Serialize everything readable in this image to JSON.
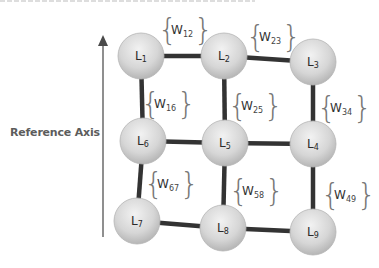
{
  "diagram": {
    "axis": {
      "label": "Reference Axis",
      "direction": "up",
      "color": "#6a6a6a"
    },
    "colors": {
      "edge": "#333333",
      "node_fill_light": "#ebebeb",
      "node_fill_dark": "#a8a8a8",
      "node_stroke": "#b5b5b5",
      "brace": "#777777",
      "text": "#2a2a2a"
    },
    "nodes": [
      {
        "id": "L1",
        "base": "L",
        "sub": "1",
        "cx": 141,
        "cy": 56
      },
      {
        "id": "L2",
        "base": "L",
        "sub": "2",
        "cx": 224,
        "cy": 56
      },
      {
        "id": "L3",
        "base": "L",
        "sub": "3",
        "cx": 313,
        "cy": 62
      },
      {
        "id": "L4",
        "base": "L",
        "sub": "4",
        "cx": 313,
        "cy": 144
      },
      {
        "id": "L5",
        "base": "L",
        "sub": "5",
        "cx": 225,
        "cy": 143
      },
      {
        "id": "L6",
        "base": "L",
        "sub": "6",
        "cx": 143,
        "cy": 141
      },
      {
        "id": "L7",
        "base": "L",
        "sub": "7",
        "cx": 137,
        "cy": 221
      },
      {
        "id": "L8",
        "base": "L",
        "sub": "8",
        "cx": 223,
        "cy": 228
      },
      {
        "id": "L9",
        "base": "L",
        "sub": "9",
        "cx": 313,
        "cy": 232
      }
    ],
    "edges": [
      {
        "from": "L1",
        "to": "L2",
        "weight": {
          "base": "W",
          "sub": "12",
          "x": 180,
          "y": 30
        }
      },
      {
        "from": "L2",
        "to": "L3",
        "weight": {
          "base": "W",
          "sub": "23",
          "x": 268,
          "y": 37
        }
      },
      {
        "from": "L1",
        "to": "L6",
        "weight": {
          "base": "W",
          "sub": "16",
          "x": 163,
          "y": 104
        }
      },
      {
        "from": "L2",
        "to": "L5",
        "weight": {
          "base": "W",
          "sub": "25",
          "x": 250,
          "y": 106
        }
      },
      {
        "from": "L3",
        "to": "L4",
        "weight": {
          "base": "W",
          "sub": "34",
          "x": 339,
          "y": 108
        }
      },
      {
        "from": "L6",
        "to": "L5",
        "weight": null
      },
      {
        "from": "L5",
        "to": "L4",
        "weight": null
      },
      {
        "from": "L6",
        "to": "L7",
        "weight": {
          "base": "W",
          "sub": "67",
          "x": 166,
          "y": 184
        }
      },
      {
        "from": "L5",
        "to": "L8",
        "weight": {
          "base": "W",
          "sub": "58",
          "x": 251,
          "y": 191
        }
      },
      {
        "from": "L4",
        "to": "L9",
        "weight": {
          "base": "W",
          "sub": "49",
          "x": 343,
          "y": 195
        }
      },
      {
        "from": "L7",
        "to": "L8",
        "weight": null
      },
      {
        "from": "L8",
        "to": "L9",
        "weight": null
      }
    ]
  }
}
